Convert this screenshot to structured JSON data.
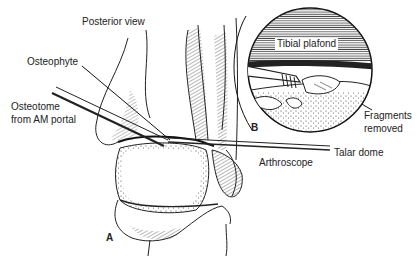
{
  "figure": {
    "panel_a_label": "A",
    "panel_b_label": "B",
    "labels": {
      "posterior_view": "Posterior view",
      "osteophyte": "Osteophyte",
      "osteotome_line1": "Osteotome",
      "osteotome_line2": "from AM portal",
      "arthroscope": "Arthroscope",
      "tibial_plafond": "Tibial plafond",
      "fragments_line1": "Fragments",
      "fragments_line2": "removed",
      "talar_dome": "Talar dome"
    },
    "colors": {
      "ink": "#222222",
      "background": "#ffffff"
    }
  }
}
